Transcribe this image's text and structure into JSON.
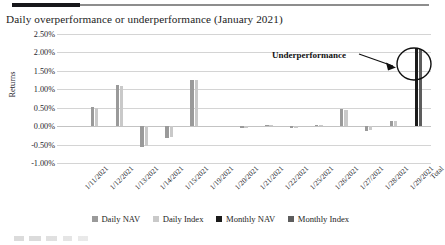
{
  "figure": {
    "title": "Daily overperformance or underperformance (January 2021)",
    "annotation": "Underperformance"
  },
  "chart_data": {
    "type": "bar",
    "title": "Daily overperformance or underperformance (January 2021)",
    "xlabel": "",
    "ylabel": "Returns",
    "ylim": [
      -1.0,
      2.5
    ],
    "ytick_labels": [
      "2.50%",
      "2.00%",
      "1.50%",
      "1.00%",
      "0.50%",
      "0.00%",
      "-0.50%",
      "-1.00%"
    ],
    "ytick_values": [
      2.5,
      2.0,
      1.5,
      1.0,
      0.5,
      0.0,
      -0.5,
      -1.0
    ],
    "grid": true,
    "legend_position": "bottom",
    "categories": [
      "1/11/2021",
      "1/12/2021",
      "1/13/2021",
      "1/14/2021",
      "1/15/2021",
      "1/19/2021",
      "1/20/2021",
      "1/21/2021",
      "1/22/2021",
      "1/25/2021",
      "1/26/2021",
      "1/27/2021",
      "1/28/2021",
      "1/29/2021",
      "Total"
    ],
    "series": [
      {
        "name": "Daily NAV",
        "color": "#9a9a9a",
        "values": [
          0.0,
          0.52,
          1.12,
          -0.56,
          -0.33,
          1.26,
          0.0,
          -0.06,
          0.04,
          -0.05,
          0.02,
          0.46,
          -0.12,
          0.14,
          0.0
        ]
      },
      {
        "name": "Daily Index",
        "color": "#c9c9c9",
        "values": [
          0.0,
          0.5,
          1.08,
          -0.53,
          -0.3,
          1.24,
          0.0,
          -0.05,
          0.03,
          -0.04,
          0.02,
          0.44,
          -0.1,
          0.13,
          0.0
        ]
      },
      {
        "name": "Monthly NAV",
        "color": "#1b1b1b",
        "values": [
          0.0,
          0.0,
          0.0,
          0.0,
          0.0,
          0.0,
          0.0,
          0.0,
          0.0,
          0.0,
          0.0,
          0.0,
          0.0,
          0.0,
          2.12
        ]
      },
      {
        "name": "Monthly Index",
        "color": "#5d5d5d",
        "values": [
          0.0,
          0.0,
          0.0,
          0.0,
          0.0,
          0.0,
          0.0,
          0.0,
          0.0,
          0.0,
          0.0,
          0.0,
          0.0,
          0.0,
          2.08
        ]
      }
    ],
    "annotations": [
      {
        "text": "Underperformance",
        "target_category": "Total",
        "marker": "ellipse-with-arrow"
      }
    ]
  },
  "legend": {
    "items": [
      {
        "label": "Daily NAV",
        "color": "#9a9a9a"
      },
      {
        "label": "Daily Index",
        "color": "#c9c9c9"
      },
      {
        "label": "Monthly NAV",
        "color": "#1b1b1b"
      },
      {
        "label": "Monthly Index",
        "color": "#5d5d5d"
      }
    ]
  }
}
